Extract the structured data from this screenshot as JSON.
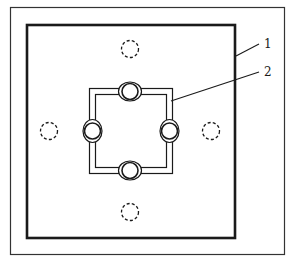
{
  "diagram": {
    "type": "technical-drawing",
    "colors": {
      "background": "#ffffff",
      "stroke": "#1a1a1a",
      "outer_frame": "#333333"
    },
    "outer_frame": {
      "x": 10,
      "y": 7,
      "width": 274,
      "height": 247
    },
    "plate": {
      "x": 26,
      "y": 24,
      "width": 209,
      "height": 214
    },
    "frame": {
      "outer": {
        "x": 89,
        "y": 88,
        "width": 83,
        "height": 85
      },
      "inner": {
        "x": 95,
        "y": 94,
        "width": 71,
        "height": 73
      }
    },
    "connectors": [
      {
        "id": "top",
        "cx": 130,
        "cy": 91
      },
      {
        "id": "right",
        "cx": 169,
        "cy": 131
      },
      {
        "id": "bottom",
        "cx": 130,
        "cy": 170
      },
      {
        "id": "left",
        "cx": 92,
        "cy": 131
      }
    ],
    "dashed_holes": [
      {
        "id": "top",
        "cx": 130,
        "cy": 49,
        "r": 8
      },
      {
        "id": "right",
        "cx": 211,
        "cy": 131,
        "r": 8
      },
      {
        "id": "bottom",
        "cx": 130,
        "cy": 212,
        "r": 8
      },
      {
        "id": "left",
        "cx": 49,
        "cy": 131,
        "r": 8
      }
    ],
    "callouts": [
      {
        "label": "1",
        "line": [
          236,
          56,
          259,
          44
        ],
        "text_x": 264,
        "text_y": 48
      },
      {
        "label": "2",
        "line": [
          171,
          101,
          259,
          72
        ],
        "text_x": 264,
        "text_y": 76
      }
    ]
  }
}
